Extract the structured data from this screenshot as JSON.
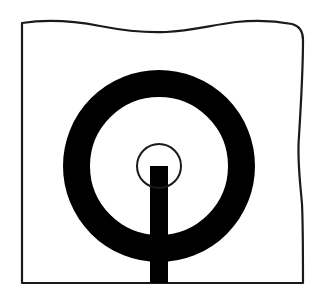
{
  "figure": {
    "canvas": {
      "width": 325,
      "height": 298,
      "background_color": "#ffffff"
    },
    "colors": {
      "stroke": "#1a1a1a",
      "fill_black": "#000000",
      "background": "#ffffff",
      "panel_fill": "#ffffff"
    },
    "panel": {
      "name": "torn-edge-panel",
      "left_x": 22,
      "right_x": 303,
      "bottom_y": 283,
      "top_y_left": 23,
      "border_width": 2.2,
      "edges": {
        "left": "straight",
        "bottom": "straight",
        "right": "wavy",
        "top": "wavy"
      },
      "top_wave_path": "M 22 23 C 48 19, 74 21, 100 26 C 126 31, 146 33, 166 32 C 190 31, 212 25, 236 22 C 256 20, 276 21, 292 24 C 300 26, 303 32, 303 40",
      "right_wave_path": "M 303 40 C 303 72, 301 104, 299 136 C 297 160, 300 180, 302 204 C 303 226, 303 256, 303 283"
    },
    "ring": {
      "name": "thick-annulus",
      "center_x": 159,
      "center_y": 166,
      "outer_radius": 96,
      "inner_radius": 69,
      "stroke_thickness": 27,
      "fill": "#000000"
    },
    "inner_circle": {
      "name": "center-circle",
      "center_x": 159,
      "center_y": 166,
      "radius": 22,
      "stroke_width": 2.0,
      "fill": "none",
      "stroke": "#1a1a1a"
    },
    "stem": {
      "name": "vertical-stem",
      "left_x": 150,
      "right_x": 168,
      "width": 18,
      "top_y": 230,
      "bottom_y": 283,
      "fill": "#000000"
    }
  }
}
